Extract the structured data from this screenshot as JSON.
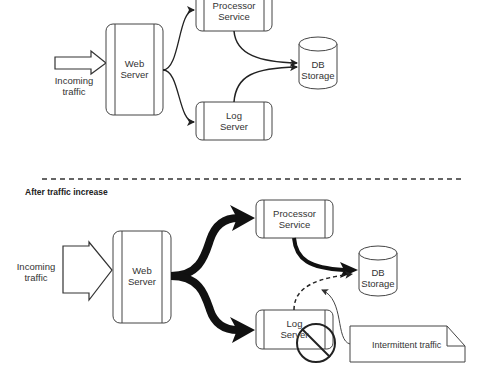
{
  "diagram": {
    "before": {
      "incoming": {
        "line1": "Incoming",
        "line2": "traffic"
      },
      "web_server": {
        "line1": "Web",
        "line2": "Server"
      },
      "processor": {
        "line1": "Processor",
        "line2": "Service"
      },
      "log_server": {
        "line1": "Log",
        "line2": "Server"
      },
      "db": {
        "line1": "DB",
        "line2": "Storage"
      }
    },
    "divider": {
      "style": "dashed"
    },
    "after": {
      "title": "After traffic increase",
      "incoming": {
        "line1": "Incoming",
        "line2": "traffic"
      },
      "web_server": {
        "line1": "Web",
        "line2": "Server"
      },
      "processor": {
        "line1": "Processor",
        "line2": "Service"
      },
      "log_server": {
        "line1": "Log",
        "line2": "Server"
      },
      "db": {
        "line1": "DB",
        "line2": "Storage"
      },
      "note": "Intermittent traffic",
      "blocked_icon": "no-entry-icon"
    },
    "colors": {
      "stroke": "#333333",
      "background": "#ffffff"
    }
  }
}
